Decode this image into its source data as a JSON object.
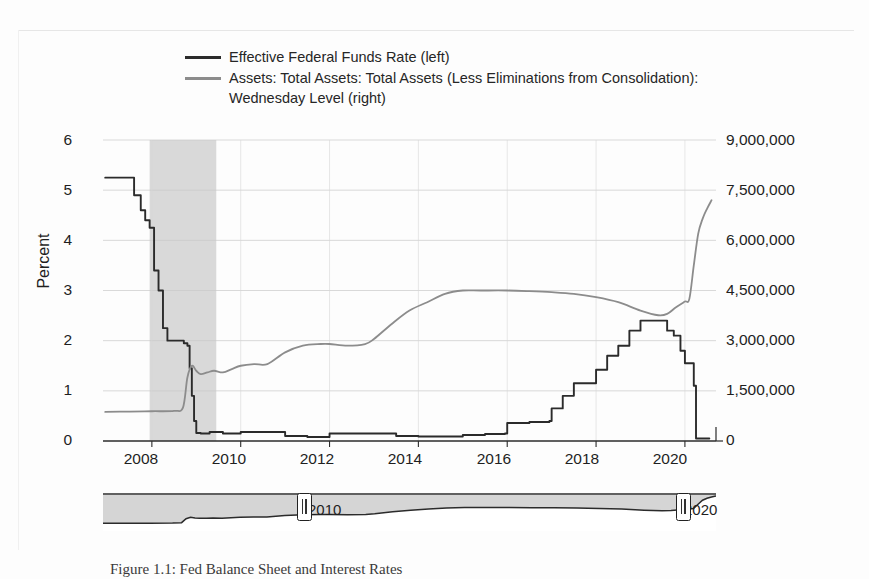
{
  "figure": {
    "background": "#fdfdfd",
    "caption": "Figure 1.1: Fed Balance Sheet and Interest Rates"
  },
  "legend": {
    "position": "top",
    "entries": [
      {
        "label": "Effective Federal Funds Rate (left)",
        "color": "#2b2b2b",
        "swatch": "line-swatch-dark"
      },
      {
        "label": "Assets: Total Assets: Total Assets (Less Eliminations from Consolidation):",
        "label_line2": "Wednesday Level (right)",
        "color": "#8c8c8c",
        "swatch": "line-swatch-gray"
      }
    ]
  },
  "axes": {
    "left_title": "Percent",
    "right_title": "Millions of US Dollars",
    "left_ticks": [
      "6",
      "5",
      "4",
      "3",
      "2",
      "1",
      "0"
    ],
    "right_ticks": [
      "9,000,000",
      "7,500,000",
      "6,000,000",
      "4,500,000",
      "3,000,000",
      "1,500,000",
      "0"
    ],
    "x_ticks": [
      "2008",
      "2010",
      "2012",
      "2014",
      "2016",
      "2018",
      "2020"
    ]
  },
  "navigator": {
    "left_year": "2010",
    "right_year": "2020",
    "left_handle_name": "range-handle-left",
    "right_handle_name": "range-handle-right"
  },
  "chart_data": {
    "type": "line",
    "title": "",
    "xlabel": "",
    "ylabel": "Percent",
    "y2label": "Millions of US Dollars",
    "xlim": [
      2006.9,
      2020.7
    ],
    "ylim": [
      0,
      6
    ],
    "y2lim": [
      0,
      9000000
    ],
    "grid": true,
    "legend_position": "top",
    "shaded_regions": [
      {
        "name": "recession",
        "x_start": 2007.95,
        "x_end": 2009.45,
        "color": "#d9d9d9"
      }
    ],
    "series": [
      {
        "name": "Effective Federal Funds Rate (left)",
        "axis": "left",
        "units": "Percent",
        "color": "#2b2b2b",
        "x": [
          2006.95,
          2007.2,
          2007.45,
          2007.6,
          2007.75,
          2007.85,
          2007.95,
          2008.05,
          2008.15,
          2008.25,
          2008.35,
          2008.45,
          2008.55,
          2008.65,
          2008.72,
          2008.8,
          2008.85,
          2008.9,
          2008.95,
          2009.0,
          2009.1,
          2009.3,
          2009.6,
          2010.0,
          2010.5,
          2011.0,
          2011.5,
          2012.0,
          2012.5,
          2013.0,
          2013.5,
          2014.0,
          2014.5,
          2015.0,
          2015.5,
          2015.95,
          2016.0,
          2016.5,
          2016.95,
          2017.0,
          2017.25,
          2017.5,
          2017.75,
          2018.0,
          2018.25,
          2018.5,
          2018.75,
          2019.0,
          2019.25,
          2019.45,
          2019.6,
          2019.75,
          2019.9,
          2020.0,
          2020.15,
          2020.2,
          2020.25,
          2020.4,
          2020.55
        ],
        "y": [
          5.25,
          5.25,
          5.25,
          4.9,
          4.6,
          4.4,
          4.25,
          3.4,
          3.0,
          2.25,
          2.0,
          2.0,
          2.0,
          2.0,
          1.95,
          1.9,
          1.45,
          0.9,
          0.4,
          0.16,
          0.15,
          0.18,
          0.15,
          0.18,
          0.18,
          0.1,
          0.08,
          0.15,
          0.15,
          0.15,
          0.1,
          0.09,
          0.09,
          0.12,
          0.14,
          0.15,
          0.36,
          0.38,
          0.4,
          0.65,
          0.9,
          1.15,
          1.15,
          1.42,
          1.7,
          1.9,
          2.2,
          2.4,
          2.4,
          2.4,
          2.2,
          2.1,
          1.8,
          1.55,
          1.55,
          1.1,
          0.05,
          0.05,
          0.05
        ]
      },
      {
        "name": "Assets: Total Assets: Total Assets (Less Eliminations from Consolidation): Wednesday Level (right)",
        "axis": "right",
        "units": "Millions of US Dollars",
        "color": "#8c8c8c",
        "x": [
          2006.95,
          2007.5,
          2008.0,
          2008.5,
          2008.7,
          2008.8,
          2008.9,
          2009.0,
          2009.1,
          2009.25,
          2009.4,
          2009.6,
          2009.8,
          2010.0,
          2010.3,
          2010.6,
          2011.0,
          2011.4,
          2011.8,
          2012.0,
          2012.4,
          2012.8,
          2013.0,
          2013.4,
          2013.8,
          2014.2,
          2014.6,
          2015.0,
          2015.4,
          2016.0,
          2016.5,
          2017.0,
          2017.5,
          2018.0,
          2018.5,
          2019.0,
          2019.4,
          2019.6,
          2019.8,
          2020.0,
          2020.1,
          2020.2,
          2020.3,
          2020.4,
          2020.5,
          2020.6
        ],
        "y": [
          870000,
          880000,
          890000,
          900000,
          1000000,
          1900000,
          2250000,
          2100000,
          2000000,
          2050000,
          2100000,
          2050000,
          2150000,
          2250000,
          2300000,
          2300000,
          2650000,
          2850000,
          2900000,
          2900000,
          2850000,
          2900000,
          3050000,
          3500000,
          3900000,
          4150000,
          4400000,
          4500000,
          4500000,
          4500000,
          4480000,
          4450000,
          4400000,
          4300000,
          4150000,
          3900000,
          3760000,
          3800000,
          4000000,
          4170000,
          4250000,
          5250000,
          6200000,
          6650000,
          6950000,
          7200000
        ]
      }
    ]
  }
}
